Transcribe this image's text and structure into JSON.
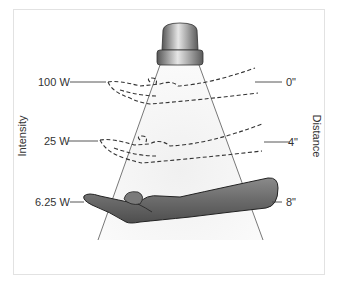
{
  "figure": {
    "axis_left_label": "Intensity",
    "axis_right_label": "Distance",
    "intensity_labels": [
      "100 W",
      "25 W",
      "6.25 W"
    ],
    "distance_labels": [
      "0\"",
      "4\"",
      "8\""
    ],
    "colors": {
      "beam": "#f3f3f3",
      "lamp_dark": "#6f6f6f",
      "lamp_light": "#d8d8d8",
      "arm": "#6e6e6e",
      "line": "#444444",
      "text": "#333333",
      "frame": "#e2e2e2"
    }
  }
}
